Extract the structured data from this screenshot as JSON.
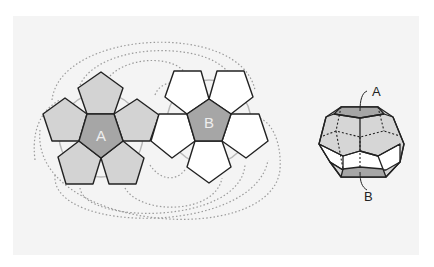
{
  "figure": {
    "net": {
      "face_a_label": "A",
      "face_b_label": "B"
    },
    "solid": {
      "label_top": "A",
      "label_bottom": "B"
    },
    "colors": {
      "panel_bg": "#f4f4f4",
      "face_a_center": "#a6a6a6",
      "face_a_petal": "#d3d3d3",
      "face_b_center": "#a6a6a6",
      "face_b_petal": "#ffffff",
      "stroke": "#222222",
      "dotted": "#9a9a9a",
      "circle": "#b8b8b8",
      "label_inner": "#eeeeee"
    }
  }
}
